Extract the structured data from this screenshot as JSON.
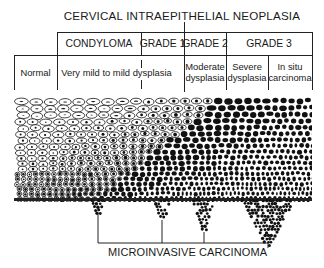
{
  "diagram": {
    "title": "CERVICAL INTRAEPITHELIAL NEOPLASIA",
    "header_row": [
      {
        "label": "CONDYLOMA",
        "x0": 57,
        "x1": 141
      },
      {
        "label": "GRADE 1",
        "x0": 141,
        "x1": 184
      },
      {
        "label": "GRADE 2",
        "x0": 184,
        "x1": 226
      },
      {
        "label": "GRADE 3",
        "x0": 226,
        "x1": 312
      }
    ],
    "stage_row": [
      {
        "label": "Normal",
        "x0": 14,
        "x1": 57
      },
      {
        "label": "Very mild to mild dysplasia",
        "x0": 57,
        "x1": 184
      },
      {
        "label": "Moderate\ndysplasia",
        "x0": 184,
        "x1": 226
      },
      {
        "label": "Severe\ndysplasia",
        "x0": 226,
        "x1": 268
      },
      {
        "label": "In situ\ncarcinoma",
        "x0": 268,
        "x1": 312
      }
    ],
    "tissue": {
      "description": "Stratified squamous epithelium progressing from normal (left) to carcinoma in situ (right)",
      "x0": 14,
      "x1": 312,
      "y0": 96,
      "y1": 201
    },
    "invasive_foci_x": [
      98,
      162,
      204,
      268
    ],
    "bottom_label": "MICROINVASIVE CARCINOMA"
  }
}
